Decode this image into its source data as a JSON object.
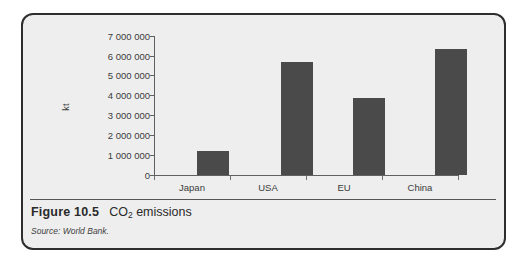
{
  "figure": {
    "number_label": "Figure 10.5",
    "title_prefix": "CO",
    "title_subscript": "2",
    "title_suffix": " emissions",
    "source_label": "Source: World Bank."
  },
  "chart_data": {
    "type": "bar",
    "title": "CO2 emissions",
    "xlabel": "",
    "ylabel": "kt",
    "categories": [
      "Japan",
      "USA",
      "EU",
      "China"
    ],
    "values": [
      1200000,
      5750000,
      3900000,
      6400000
    ],
    "ylim": [
      0,
      7000000
    ],
    "ytick_values": [
      0,
      1000000,
      2000000,
      3000000,
      4000000,
      5000000,
      6000000,
      7000000
    ],
    "ytick_labels": [
      "0",
      "1 000 000",
      "2 000 000",
      "3 000 000",
      "4 000 000",
      "5 000 000",
      "6 000 000",
      "7 000 000"
    ],
    "grid": false,
    "legend": false,
    "bar_color": "#4a4a4a",
    "axis_color": "#606060",
    "plot_background": "#eeeeee"
  }
}
